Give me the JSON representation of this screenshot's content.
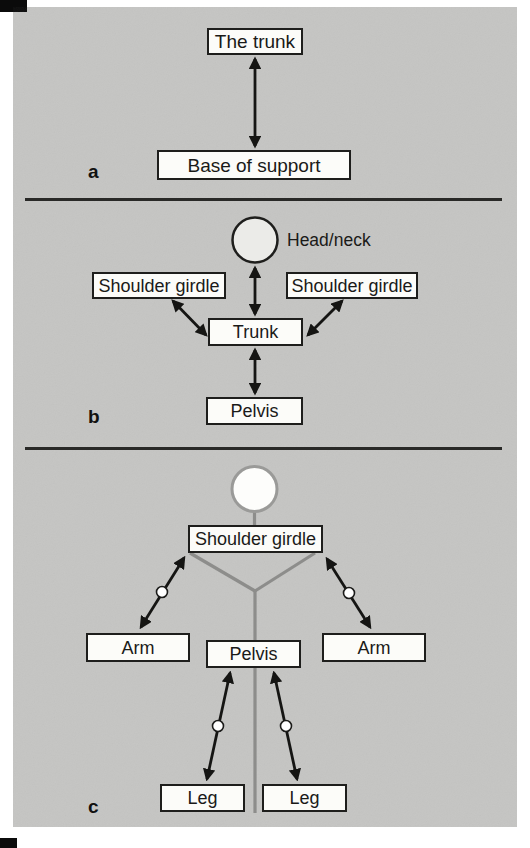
{
  "figure": {
    "panel_a": {
      "label": "a",
      "trunk": "The trunk",
      "base": "Base of support"
    },
    "panel_b": {
      "label": "b",
      "head": "Head/neck",
      "shoulder_left": "Shoulder girdle",
      "shoulder_right": "Shoulder girdle",
      "trunk": "Trunk",
      "pelvis": "Pelvis"
    },
    "panel_c": {
      "label": "c",
      "shoulder": "Shoulder girdle",
      "arm_left": "Arm",
      "arm_right": "Arm",
      "pelvis": "Pelvis",
      "leg_left": "Leg",
      "leg_right": "Leg"
    }
  },
  "colors": {
    "panel_bg": "#c5c5c3",
    "box_fill": "#fcfcf9",
    "ink": "#1b1b19",
    "skeleton_gray": "#8d8d8b",
    "head_circle_b_fill": "#ebebe8",
    "head_circle_c_stroke": "#9a9a98",
    "joint_fill": "#ffffff"
  }
}
